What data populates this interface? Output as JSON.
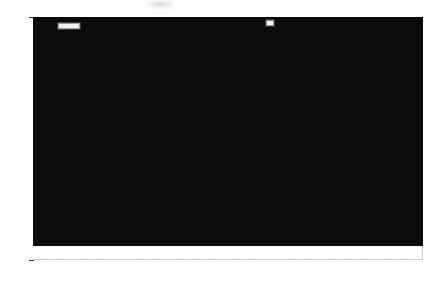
{
  "chart_data": {
    "type": "area",
    "subtitle": "",
    "xlabel": "",
    "ylabel": "",
    "stacked": true,
    "grid": true,
    "legend_position": "top-right",
    "xlim": [
      1929,
      2006
    ],
    "ylim": [
      -0.1,
      1.0
    ],
    "ytick_labels": [
      "100%",
      "90%",
      "80%",
      "70%",
      "60%",
      "50%",
      "40%",
      "30%",
      "20%",
      "10%",
      "0%",
      "-10%"
    ],
    "ytick_values": [
      100,
      90,
      80,
      70,
      60,
      50,
      40,
      30,
      20,
      10,
      0,
      -10
    ],
    "xtick_labels": [
      "1930",
      "1940",
      "1950",
      "1960",
      "1970",
      "1980",
      "1990",
      "2000"
    ],
    "xtick_values": [
      1930,
      1940,
      1950,
      1960,
      1970,
      1980,
      1990,
      2000
    ],
    "x": [
      1929,
      1932,
      1935,
      1938,
      1941,
      1944,
      1947,
      1950,
      1953,
      1956,
      1959,
      1962,
      1965,
      1968,
      1971,
      1974,
      1977,
      1980,
      1983,
      1986,
      1989,
      1991,
      1993,
      1996,
      1999,
      2002,
      2005
    ],
    "series": [
      {
        "name": "Corporate Income Real Estate",
        "color": "#f7f7f7",
        "values": [
          0.6,
          0.5,
          0.5,
          0.5,
          0.6,
          0.6,
          0.7,
          0.7,
          0.7,
          0.7,
          0.7,
          0.7,
          0.8,
          0.8,
          0.8,
          0.8,
          0.8,
          0.8,
          0.7,
          0.7,
          0.6,
          0.5,
          0.6,
          0.8,
          0.9,
          0.9,
          1.0
        ]
      },
      {
        "name": "Income Proprietors (FIRE Sector)",
        "color": "#e8e8e8",
        "values": [
          9.0,
          7.5,
          8.0,
          8.5,
          9.5,
          10.5,
          11.5,
          12.5,
          13.0,
          13.0,
          12.5,
          12.5,
          12.5,
          12.0,
          11.5,
          11.0,
          11.0,
          10.5,
          9.5,
          9.0,
          8.0,
          7.0,
          7.5,
          9.0,
          10.0,
          10.5,
          10.5
        ]
      },
      {
        "name": "Rental Income of Persons",
        "color": "#141414",
        "values": [
          8.0,
          7.0,
          6.5,
          6.5,
          7.0,
          7.5,
          8.0,
          8.5,
          8.5,
          8.0,
          7.5,
          7.0,
          6.5,
          6.0,
          5.5,
          5.0,
          4.5,
          4.0,
          3.0,
          2.5,
          2.0,
          1.5,
          2.0,
          3.5,
          5.0,
          6.0,
          6.5
        ]
      },
      {
        "name": "Depreciation, Corporate",
        "color": "#8e8e8e",
        "values": [
          4.0,
          3.5,
          3.5,
          4.0,
          4.5,
          5.0,
          6.0,
          7.0,
          7.5,
          8.0,
          8.0,
          8.0,
          8.0,
          8.0,
          7.5,
          7.0,
          7.0,
          7.0,
          6.5,
          6.0,
          5.0,
          4.5,
          5.0,
          6.5,
          8.0,
          9.0,
          9.5
        ]
      },
      {
        "name": "Depreciation, Non-Corporate",
        "color": "#5a5a5a",
        "values": [
          9.0,
          8.5,
          8.0,
          8.0,
          8.5,
          9.0,
          9.5,
          10.0,
          10.5,
          10.5,
          10.5,
          10.0,
          10.0,
          9.5,
          9.0,
          9.0,
          9.0,
          8.5,
          8.0,
          7.5,
          6.5,
          6.0,
          6.5,
          8.0,
          9.5,
          10.0,
          10.5
        ]
      },
      {
        "name": "Property Taxes, Local",
        "color": "#2b2b2b",
        "values": [
          2.5,
          2.5,
          2.0,
          2.0,
          2.0,
          2.0,
          2.0,
          2.0,
          2.0,
          2.0,
          2.0,
          2.0,
          2.0,
          2.0,
          2.0,
          1.8,
          1.8,
          1.6,
          1.5,
          1.4,
          1.2,
          1.1,
          1.2,
          1.4,
          1.5,
          1.6,
          1.6
        ]
      },
      {
        "name": "Real Estate Interest",
        "color": "#1c1c1c",
        "values": [
          1.0,
          1.0,
          1.0,
          1.0,
          1.0,
          1.0,
          1.0,
          1.0,
          1.0,
          1.0,
          1.0,
          1.0,
          1.0,
          1.0,
          1.0,
          1.0,
          1.0,
          1.0,
          1.0,
          1.0,
          0.9,
          0.8,
          0.9,
          1.0,
          1.0,
          1.0,
          1.0
        ]
      }
    ],
    "totals": [
      34.1,
      30.5,
      29.5,
      30.5,
      33.1,
      35.6,
      38.7,
      41.7,
      43.2,
      43.2,
      42.2,
      41.2,
      40.8,
      39.3,
      37.3,
      35.6,
      35.1,
      33.4,
      30.2,
      28.1,
      24.2,
      21.4,
      23.7,
      30.2,
      35.9,
      39.0,
      40.6
    ]
  },
  "legend": {
    "items": [
      {
        "label": "Real Estate Interest",
        "color": "#1c1c1c"
      },
      {
        "label": "Property Taxes, Local",
        "color": "#2b2b2b"
      },
      {
        "label": "Depreciation, Non-Corporate",
        "color": "#5a5a5a"
      },
      {
        "label": "Depreciation, Corporate",
        "color": "#8e8e8e"
      },
      {
        "label": "Rental Income of Persons",
        "color": "#141414"
      },
      {
        "label": "Income Proprietors (FIRE Sector)",
        "color": "#3a3a3a"
      },
      {
        "label": "Corporate Income Real Estate",
        "color": "#f7f7f7"
      }
    ]
  }
}
